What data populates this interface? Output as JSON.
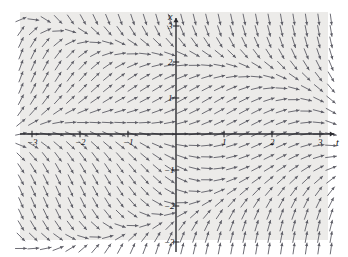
{
  "figure": {
    "type": "direction-field",
    "background_color": "#ffffff",
    "plot_background_color": "#ecebe9",
    "axis_color": "#2b2b30",
    "arrow_color": "#5d5d66",
    "width": 348,
    "height": 257
  },
  "axes": {
    "x_axis": {
      "label": "t",
      "label_x": 336,
      "label_y": 140,
      "pixel_y": 134,
      "min": -3.45,
      "max": 3.45,
      "ticks": [
        {
          "value": -3,
          "label": "−3",
          "px": 32
        },
        {
          "value": -2,
          "label": "−2",
          "px": 80
        },
        {
          "value": -1,
          "label": "−1",
          "px": 128
        },
        {
          "value": 1,
          "label": "1",
          "px": 224
        },
        {
          "value": 2,
          "label": "2",
          "px": 272
        },
        {
          "value": 3,
          "label": "3",
          "px": 320
        }
      ]
    },
    "y_axis": {
      "label": "x",
      "label_x": 168,
      "label_y": 12,
      "pixel_x": 176,
      "min": -3.3,
      "max": 3.3,
      "ticks": [
        {
          "value": 3,
          "label": "3",
          "px": 26
        },
        {
          "value": 2,
          "label": "2",
          "px": 62
        },
        {
          "value": 1,
          "label": "1",
          "px": 98
        },
        {
          "value": -1,
          "label": "−1",
          "px": 170
        },
        {
          "value": -2,
          "label": "−2",
          "px": 206
        },
        {
          "value": -3,
          "label": "−3",
          "px": 242
        }
      ]
    }
  },
  "chart_data": {
    "type": "scatter",
    "title": "",
    "xlabel": "t",
    "ylabel": "x",
    "xlim": [
      -3.45,
      3.45
    ],
    "ylim": [
      -3.3,
      3.3
    ],
    "grid": false,
    "legend": null,
    "field": {
      "grid_columns": 26,
      "grid_rows": 21,
      "arrow_length_px": 11,
      "arrow_head_px": 3,
      "slope_formula": "dx/dt = x*(1 - x*x/4) - t*x/2 + t*(1 - t*t/9)*0.55",
      "sample_vectors": [
        {
          "t": -3.0,
          "x": 3.0,
          "dir_deg": 0
        },
        {
          "t": -2.0,
          "x": 3.0,
          "dir_deg": -62
        },
        {
          "t": -1.0,
          "x": 3.0,
          "dir_deg": -80
        },
        {
          "t": 0.0,
          "x": 3.0,
          "dir_deg": -88
        },
        {
          "t": 1.0,
          "x": 3.0,
          "dir_deg": -86
        },
        {
          "t": 2.0,
          "x": 3.0,
          "dir_deg": -74
        },
        {
          "t": 3.0,
          "x": 3.0,
          "dir_deg": 2
        },
        {
          "t": -3.0,
          "x": 1.0,
          "dir_deg": -72
        },
        {
          "t": -1.0,
          "x": 1.0,
          "dir_deg": -18
        },
        {
          "t": 0.0,
          "x": 1.0,
          "dir_deg": -6
        },
        {
          "t": 1.0,
          "x": 1.0,
          "dir_deg": -26
        },
        {
          "t": 3.0,
          "x": 1.0,
          "dir_deg": -70
        },
        {
          "t": -3.0,
          "x": 0.0,
          "dir_deg": -86
        },
        {
          "t": -1.0,
          "x": 0.0,
          "dir_deg": 0
        },
        {
          "t": 0.0,
          "x": 0.0,
          "dir_deg": 0
        },
        {
          "t": 1.0,
          "x": 0.0,
          "dir_deg": 0
        },
        {
          "t": 3.0,
          "x": 0.0,
          "dir_deg": -84
        },
        {
          "t": -3.0,
          "x": -1.0,
          "dir_deg": -70
        },
        {
          "t": -1.0,
          "x": -1.0,
          "dir_deg": 26
        },
        {
          "t": 0.0,
          "x": -1.0,
          "dir_deg": 6
        },
        {
          "t": 1.0,
          "x": -1.0,
          "dir_deg": 18
        },
        {
          "t": 3.0,
          "x": -1.0,
          "dir_deg": -72
        },
        {
          "t": -3.0,
          "x": -3.0,
          "dir_deg": -2
        },
        {
          "t": -2.0,
          "x": -3.0,
          "dir_deg": 74
        },
        {
          "t": 0.0,
          "x": -3.0,
          "dir_deg": 88
        },
        {
          "t": 2.0,
          "x": -3.0,
          "dir_deg": 62
        },
        {
          "t": 3.0,
          "x": -3.0,
          "dir_deg": 0
        }
      ]
    }
  }
}
